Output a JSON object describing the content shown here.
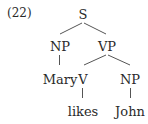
{
  "example_number": "(22)",
  "tree": {
    "root": "S",
    "nodes": {
      "s": "S",
      "np_subject": "NP",
      "vp": "VP",
      "subject_word": "Mary",
      "verb": "V",
      "np_object": "NP",
      "verb_word": "likes",
      "object_word": "John"
    },
    "structure": "[S [NP Mary] [VP [V likes] [NP John]]]"
  }
}
